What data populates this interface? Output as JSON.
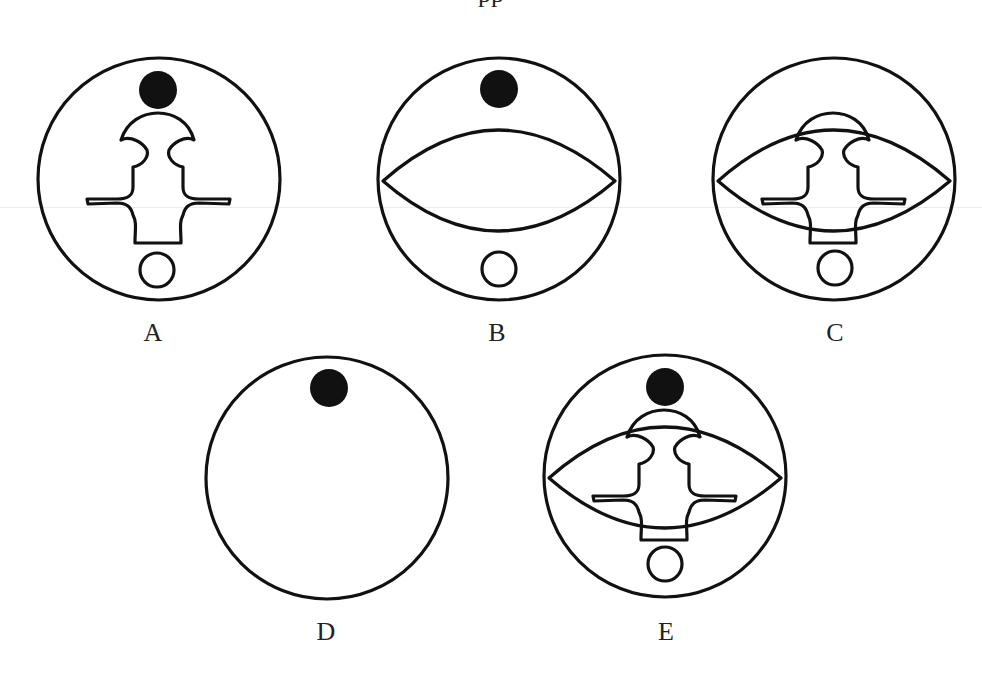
{
  "header": {
    "caption_partial": "pp"
  },
  "colors": {
    "stroke": "#111111",
    "fill_dot": "#111111",
    "background": "#ffffff"
  },
  "options": [
    {
      "label": "A",
      "cx": 159,
      "cy": 179,
      "r": 121,
      "elements": [
        "outer-circle",
        "black-dot",
        "keyhole-figure",
        "small-open-circle"
      ]
    },
    {
      "label": "B",
      "cx": 499,
      "cy": 179,
      "r": 121,
      "elements": [
        "outer-circle",
        "black-dot",
        "lens",
        "small-open-circle"
      ]
    },
    {
      "label": "C",
      "cx": 834,
      "cy": 179,
      "r": 121,
      "elements": [
        "outer-circle",
        "lens",
        "keyhole-figure",
        "small-open-circle"
      ]
    },
    {
      "label": "D",
      "cx": 327,
      "cy": 478,
      "r": 121,
      "elements": [
        "outer-circle",
        "black-dot"
      ]
    },
    {
      "label": "E",
      "cx": 665,
      "cy": 476,
      "r": 121,
      "elements": [
        "outer-circle",
        "black-dot",
        "lens",
        "keyhole-figure",
        "small-open-circle"
      ]
    }
  ],
  "labels": {
    "a": "A",
    "b": "B",
    "c": "C",
    "d": "D",
    "e": "E"
  }
}
